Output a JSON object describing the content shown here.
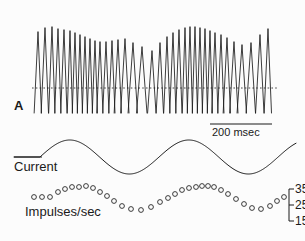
{
  "figure": {
    "panel_letter": "A",
    "background_color": "#fcfcfc",
    "ink_color": "#1a1a1a"
  },
  "scale_bar": {
    "label": "200 msec",
    "x_start": 210,
    "x_end": 272,
    "y": 124
  },
  "traces": {
    "spike_train": {
      "name": "spike-train",
      "baseline_label": "",
      "baseline_y": 88,
      "x_start": 38,
      "x_end": 274,
      "top_y": 17,
      "bottom_y": 113,
      "spike_times": [
        38,
        45,
        52,
        58,
        64,
        70,
        75,
        80,
        85,
        90,
        95,
        100,
        106,
        112,
        118,
        125,
        133,
        142,
        152,
        160,
        167,
        173,
        179,
        185,
        190,
        195,
        200,
        205,
        210,
        215,
        221,
        227,
        234,
        242,
        251,
        260,
        268
      ],
      "spike_heights": [
        81,
        85,
        86,
        84,
        83,
        82,
        80,
        78,
        76,
        74,
        72,
        71,
        71,
        72,
        73,
        74,
        70,
        66,
        62,
        70,
        76,
        80,
        83,
        85,
        86,
        86,
        85,
        84,
        82,
        80,
        78,
        75,
        71,
        68,
        70,
        78,
        84
      ]
    },
    "current": {
      "name": "current-trace",
      "label": "Current",
      "flat_x_start": 14,
      "flat_x_end": 40,
      "baseline_y": 157,
      "amplitude": 17,
      "cycles": 2.15,
      "sine_x_start": 40,
      "sine_x_end": 296,
      "label_x": 14,
      "label_y": 160
    },
    "rate_plot": {
      "name": "impulse-rate-plot",
      "label": "Impulses/sec",
      "label_x": 25,
      "label_y": 205,
      "marker_radius": 2.4,
      "points": [
        {
          "x": 34,
          "y": 197
        },
        {
          "x": 42,
          "y": 197
        },
        {
          "x": 50,
          "y": 197
        },
        {
          "x": 58,
          "y": 192
        },
        {
          "x": 65,
          "y": 189
        },
        {
          "x": 72,
          "y": 187
        },
        {
          "x": 79,
          "y": 187
        },
        {
          "x": 86,
          "y": 186
        },
        {
          "x": 93,
          "y": 188
        },
        {
          "x": 100,
          "y": 192
        },
        {
          "x": 107,
          "y": 196
        },
        {
          "x": 114,
          "y": 201
        },
        {
          "x": 122,
          "y": 206
        },
        {
          "x": 131,
          "y": 209
        },
        {
          "x": 141,
          "y": 210
        },
        {
          "x": 151,
          "y": 207
        },
        {
          "x": 160,
          "y": 202
        },
        {
          "x": 168,
          "y": 198
        },
        {
          "x": 175,
          "y": 194
        },
        {
          "x": 182,
          "y": 190
        },
        {
          "x": 189,
          "y": 188
        },
        {
          "x": 196,
          "y": 187
        },
        {
          "x": 202,
          "y": 186
        },
        {
          "x": 208,
          "y": 186
        },
        {
          "x": 214,
          "y": 187
        },
        {
          "x": 221,
          "y": 190
        },
        {
          "x": 228,
          "y": 194
        },
        {
          "x": 236,
          "y": 199
        },
        {
          "x": 244,
          "y": 204
        },
        {
          "x": 252,
          "y": 208
        },
        {
          "x": 261,
          "y": 209
        },
        {
          "x": 270,
          "y": 206
        },
        {
          "x": 277,
          "y": 201
        },
        {
          "x": 284,
          "y": 197
        }
      ]
    }
  },
  "y_axis": {
    "name": "rate-axis",
    "bracket_x": 289,
    "bracket_top_y": 189,
    "bracket_bottom_y": 221,
    "tick_length": 5,
    "ticks": [
      {
        "label": "35",
        "y": 189
      },
      {
        "label": "25",
        "y": 205
      },
      {
        "label": "15",
        "y": 221
      }
    ],
    "label_x": 295
  },
  "chart_data": {
    "type": "line",
    "title": "",
    "xlabel": "",
    "ylabel": "Impulses/sec",
    "panels": [
      {
        "name": "spike-train",
        "type": "line",
        "description": "Intracellular membrane potential recording showing action potential spikes over time, with dashed baseline reference.",
        "n_spikes": 37
      },
      {
        "name": "current",
        "type": "line",
        "description": "Sinusoidal injected current stimulus, approximately 2 cycles.",
        "label": "Current"
      },
      {
        "name": "impulse-rate",
        "type": "scatter",
        "ylabel": "Impulses/sec",
        "ytick_labels": [
          "35",
          "25",
          "15"
        ],
        "ytick_values": [
          35,
          25,
          15
        ],
        "ylim": [
          10,
          40
        ],
        "values": [
          25,
          25,
          25,
          28,
          30,
          31,
          31,
          32,
          30,
          28,
          25,
          22,
          19,
          17,
          16,
          18,
          21,
          24,
          26,
          29,
          30,
          31,
          32,
          32,
          31,
          29,
          27,
          24,
          21,
          18,
          17,
          19,
          22,
          25
        ]
      }
    ],
    "scale_bar": {
      "label": "200 msec",
      "value": 200,
      "unit": "msec"
    }
  }
}
